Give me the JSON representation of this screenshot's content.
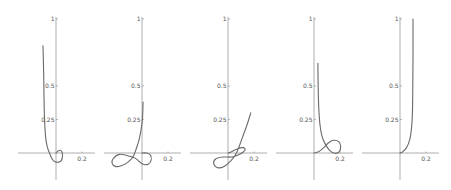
{
  "chart_data": {
    "type": "line",
    "title": "",
    "layout": {
      "panels": 5,
      "arrangement": "single row",
      "grid": false,
      "legend": false
    },
    "colors": {
      "axis": "#9a9a9a",
      "curve": "#6a6a6a",
      "tick_label": "#555555"
    },
    "shared_axes": {
      "y_ticks": [
        {
          "value": 0.25,
          "label": "0.25"
        },
        {
          "value": 0.5,
          "label": "0.5"
        },
        {
          "value": 1,
          "label": "1"
        }
      ],
      "x_ticks": [
        {
          "value": 0.2,
          "label": "0.2"
        }
      ],
      "xlim": [
        -0.29,
        0.3
      ],
      "ylim": [
        -0.2,
        1.0
      ]
    },
    "panels": [
      {
        "name": "panel-1",
        "x": [
          -0.1,
          -0.095,
          -0.092,
          -0.088,
          -0.08,
          -0.068,
          -0.05,
          -0.03,
          -0.008,
          0.02,
          0.042,
          0.05,
          0.045,
          0.03,
          0.012,
          0.0
        ],
        "y": [
          0.8,
          0.6,
          0.4,
          0.25,
          0.12,
          0.05,
          0.0,
          -0.045,
          -0.065,
          -0.068,
          -0.055,
          -0.02,
          0.01,
          0.02,
          0.012,
          0.0
        ]
      },
      {
        "name": "panel-2",
        "x": [
          0.008,
          0.006,
          0.0,
          -0.02,
          -0.045,
          -0.07,
          -0.11,
          -0.16,
          -0.205,
          -0.23,
          -0.22,
          -0.175,
          -0.11,
          -0.05,
          0.0,
          0.045,
          0.07,
          0.065,
          0.035,
          0.0
        ],
        "y": [
          0.38,
          0.3,
          0.22,
          0.11,
          0.03,
          -0.03,
          -0.07,
          -0.095,
          -0.1,
          -0.075,
          -0.04,
          -0.01,
          -0.02,
          -0.04,
          -0.08,
          -0.085,
          -0.055,
          -0.015,
          0.0,
          0.0
        ]
      },
      {
        "name": "panel-3",
        "x": [
          0.175,
          0.15,
          0.12,
          0.09,
          0.06,
          0.02,
          -0.03,
          -0.08,
          -0.11,
          -0.095,
          -0.04,
          0.03,
          0.09,
          0.13,
          0.12,
          0.07,
          0.02,
          0.0
        ],
        "y": [
          0.3,
          0.22,
          0.14,
          0.06,
          -0.01,
          -0.06,
          -0.1,
          -0.11,
          -0.08,
          -0.045,
          -0.03,
          -0.03,
          -0.01,
          0.02,
          0.04,
          0.03,
          0.005,
          0.0
        ]
      },
      {
        "name": "panel-4",
        "x": [
          0.03,
          0.032,
          0.036,
          0.045,
          0.06,
          0.085,
          0.12,
          0.16,
          0.195,
          0.205,
          0.19,
          0.15,
          0.11,
          0.075,
          0.04,
          0.01,
          0.0
        ],
        "y": [
          0.67,
          0.5,
          0.35,
          0.22,
          0.13,
          0.07,
          0.02,
          -0.002,
          0.01,
          0.05,
          0.085,
          0.095,
          0.075,
          0.04,
          0.012,
          0.002,
          0.0
        ]
      },
      {
        "name": "panel-5",
        "x": [
          0.0,
          0.02,
          0.05,
          0.075,
          0.088,
          0.095,
          0.098,
          0.1,
          0.1
        ],
        "y": [
          0.0,
          0.008,
          0.04,
          0.1,
          0.18,
          0.28,
          0.45,
          0.7,
          1.0
        ]
      }
    ]
  }
}
